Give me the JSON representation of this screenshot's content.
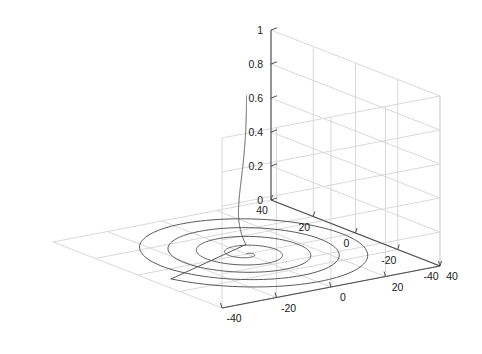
{
  "figure": {
    "background": "#ffffff",
    "width": 482,
    "height": 354
  },
  "chart_data": {
    "type": "line",
    "title": "",
    "subtitle": "",
    "projection": "3d",
    "xlabel": "",
    "ylabel": "",
    "zlabel": "",
    "xlim": [
      -40,
      40
    ],
    "ylim": [
      -40,
      40
    ],
    "zlim": [
      0,
      1
    ],
    "xticks": [
      -40,
      -20,
      0,
      20,
      40
    ],
    "yticks": [
      -40,
      -20,
      0,
      20,
      40
    ],
    "zticks": [
      0,
      0.2,
      0.4,
      0.6,
      0.8,
      1
    ],
    "xticklabels": [
      "-40",
      "-20",
      "0",
      "20",
      "40"
    ],
    "yticklabels": [
      "-40",
      "-20",
      "0",
      "20",
      "40"
    ],
    "zticklabels": [
      "0",
      "0.2",
      "0.4",
      "0.6",
      "0.8",
      "1"
    ],
    "left_axis_labels_left_to_right": [
      "40",
      "20",
      "0",
      "-20",
      "-40"
    ],
    "right_axis_labels_left_to_right": [
      "-40",
      "-20",
      "0",
      "20",
      "40"
    ],
    "grid": true,
    "legend": null,
    "legend_position": "none",
    "view": {
      "azimuth": -37.5,
      "elevation": 30
    },
    "series": [
      {
        "name": "decaying-spiral-trajectory",
        "color": "#595959",
        "linewidth": 1,
        "description": "Trajectory descending vertically from z=0.93 then spiralling inward on the z=0 floor plane",
        "turns": 4.6,
        "radius_start": 38,
        "radius_end": 0,
        "z_start": 0.93,
        "z_descent_end": 0.02,
        "samples": 900
      }
    ],
    "annotations": []
  },
  "axes": {
    "line_color": "#4d4d4d",
    "grid_color": "#d9d9d9",
    "tick_color": "#4d4d4d",
    "pane_color": "#ffffff"
  }
}
